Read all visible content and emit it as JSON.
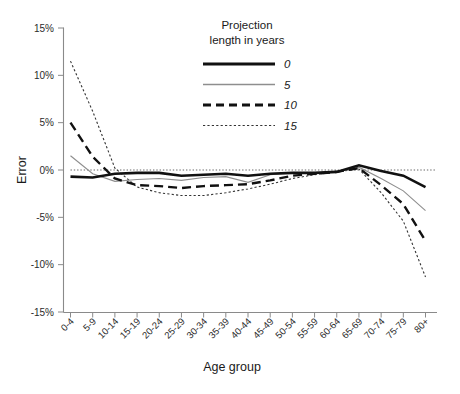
{
  "chart_data": {
    "type": "line",
    "title": "",
    "xlabel": "Age group",
    "ylabel": "Error",
    "categories": [
      "0-4",
      "5-9",
      "10-14",
      "15-19",
      "20-24",
      "25-29",
      "30-34",
      "35-39",
      "40-44",
      "45-49",
      "50-54",
      "55-59",
      "60-64",
      "65-69",
      "70-74",
      "75-79",
      "80+"
    ],
    "ylim": [
      -15,
      15
    ],
    "yticks": [
      "-15%",
      "-10%",
      "-5%",
      "0%",
      "5%",
      "10%",
      "15%"
    ],
    "ytick_values": [
      -15,
      -10,
      -5,
      0,
      5,
      10,
      15
    ],
    "grid": false,
    "zero_reference_line": true,
    "legend_position": "top-right",
    "legend_title_line1": "Projection",
    "legend_title_line2": "length in years",
    "series": [
      {
        "name": "0",
        "style": "solid-thick",
        "values": [
          -0.7,
          -0.8,
          -0.4,
          -0.3,
          -0.3,
          -0.6,
          -0.5,
          -0.4,
          -0.6,
          -0.4,
          -0.3,
          -0.3,
          -0.2,
          0.5,
          -0.1,
          -0.6,
          -1.8
        ]
      },
      {
        "name": "5",
        "style": "solid-thin",
        "values": [
          1.5,
          -0.4,
          -1.2,
          -1.0,
          -0.9,
          -1.1,
          -0.8,
          -0.7,
          -1.3,
          -0.5,
          -0.3,
          -0.3,
          -0.2,
          0.3,
          -0.9,
          -2.2,
          -4.3
        ]
      },
      {
        "name": "10",
        "style": "dashed",
        "values": [
          5.0,
          1.4,
          -0.9,
          -1.6,
          -1.7,
          -1.9,
          -1.7,
          -1.6,
          -1.5,
          -1.1,
          -0.6,
          -0.4,
          -0.2,
          0.2,
          -1.6,
          -3.6,
          -7.5
        ]
      },
      {
        "name": "15",
        "style": "dotted",
        "values": [
          11.5,
          6.2,
          0.2,
          -1.8,
          -2.4,
          -2.7,
          -2.7,
          -2.4,
          -2.0,
          -1.5,
          -0.9,
          -0.5,
          -0.2,
          0.1,
          -2.4,
          -5.4,
          -11.3
        ]
      }
    ]
  },
  "legend": {
    "title_line1": "Projection",
    "title_line2": "length in years",
    "entries": [
      {
        "label": "0"
      },
      {
        "label": "5"
      },
      {
        "label": "10"
      },
      {
        "label": "15"
      }
    ]
  },
  "axes": {
    "y_title": "Error",
    "x_title": "Age group"
  }
}
